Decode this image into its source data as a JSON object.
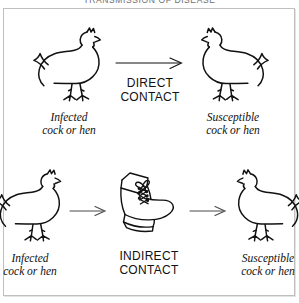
{
  "figure": {
    "title_cropped": "TRANSMISSION OF DISEASE",
    "frame_color": "#bfbfbf",
    "ink_color": "#111111",
    "background": "#ffffff"
  },
  "rows": [
    {
      "id": "direct",
      "mode_label_line1": "DIRECT",
      "mode_label_line2": "CONTACT",
      "source": {
        "icon": "hen-icon",
        "facing": "right",
        "caption_line1": "Infected",
        "caption_line2": "cock or hen"
      },
      "target": {
        "icon": "hen-icon",
        "facing": "left",
        "caption_line1": "Susceptible",
        "caption_line2": "cock or hen"
      },
      "arrows": 1
    },
    {
      "id": "indirect",
      "mode_label_line1": "INDIRECT",
      "mode_label_line2": "CONTACT",
      "source": {
        "icon": "hen-icon",
        "facing": "right",
        "caption_line1": "Infected",
        "caption_line2": "cock or hen"
      },
      "vector": {
        "icon": "boot-icon",
        "description": "laced work boot"
      },
      "target": {
        "icon": "hen-icon",
        "facing": "left",
        "caption_line1": "Susceptible",
        "caption_line2": "cock or hen"
      },
      "arrows": 2
    }
  ]
}
